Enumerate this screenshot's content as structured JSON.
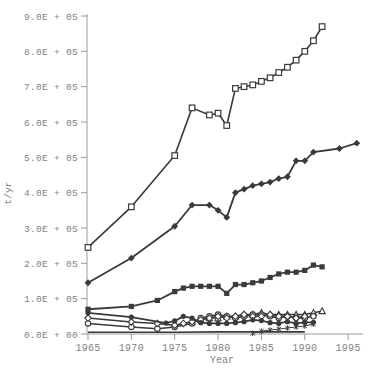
{
  "page": {
    "background": "#ffffff"
  },
  "chart_data": {
    "type": "line",
    "title": "",
    "xlabel": "Year",
    "ylabel": "t/yr",
    "xlim": [
      1965,
      1996.6
    ],
    "ylim": [
      0,
      900000
    ],
    "grid": false,
    "legend": "none",
    "frame": "left-bottom-only",
    "x_ticks": [
      1965,
      1970,
      1975,
      1980,
      1985,
      1990,
      1995
    ],
    "x_tick_labels": [
      "1965",
      "1970",
      "1975",
      "1980",
      "1985",
      "1990",
      "1995"
    ],
    "y_ticks": [
      0,
      100000,
      200000,
      300000,
      400000,
      500000,
      600000,
      700000,
      800000,
      900000
    ],
    "y_tick_labels": [
      "0.0E + 00",
      "1.0E + 05",
      "2.0E + 05",
      "3.0E + 05",
      "4.0E + 05",
      "5.0E + 05",
      "6.0E + 05",
      "7.0E + 05",
      "8.0E + 05",
      "9.0E + 05"
    ],
    "colors": {
      "line": "#3a3a3a",
      "axis": "#9b9b9b",
      "tick_text": "#7f7f7f",
      "open_marker_fill": "#ffffff"
    },
    "series": [
      {
        "name": "series-open-square",
        "marker": "square-open",
        "points": [
          [
            1965,
            245000
          ],
          [
            1970,
            360000
          ],
          [
            1975,
            505000
          ],
          [
            1977,
            640000
          ],
          [
            1979,
            620000
          ],
          [
            1980,
            625000
          ],
          [
            1981,
            590000
          ],
          [
            1982,
            695000
          ],
          [
            1983,
            700000
          ],
          [
            1984,
            705000
          ],
          [
            1985,
            715000
          ],
          [
            1986,
            725000
          ],
          [
            1987,
            740000
          ],
          [
            1988,
            755000
          ],
          [
            1989,
            775000
          ],
          [
            1990,
            800000
          ],
          [
            1991,
            830000
          ],
          [
            1992,
            870000
          ]
        ]
      },
      {
        "name": "series-filled-diamond-large",
        "marker": "diamond-filled",
        "points": [
          [
            1965,
            145000
          ],
          [
            1970,
            215000
          ],
          [
            1975,
            305000
          ],
          [
            1977,
            365000
          ],
          [
            1979,
            365000
          ],
          [
            1980,
            350000
          ],
          [
            1981,
            330000
          ],
          [
            1982,
            400000
          ],
          [
            1983,
            410000
          ],
          [
            1984,
            420000
          ],
          [
            1985,
            425000
          ],
          [
            1986,
            430000
          ],
          [
            1987,
            440000
          ],
          [
            1988,
            445000
          ],
          [
            1989,
            490000
          ],
          [
            1990,
            490000
          ],
          [
            1991,
            515000
          ],
          [
            1994,
            525000
          ],
          [
            1996,
            540000
          ]
        ]
      },
      {
        "name": "series-filled-square",
        "marker": "square-filled",
        "points": [
          [
            1965,
            70000
          ],
          [
            1970,
            78000
          ],
          [
            1973,
            95000
          ],
          [
            1975,
            120000
          ],
          [
            1976,
            130000
          ],
          [
            1977,
            135000
          ],
          [
            1978,
            135000
          ],
          [
            1979,
            135000
          ],
          [
            1980,
            135000
          ],
          [
            1981,
            115000
          ],
          [
            1982,
            140000
          ],
          [
            1983,
            140000
          ],
          [
            1984,
            145000
          ],
          [
            1985,
            150000
          ],
          [
            1986,
            160000
          ],
          [
            1987,
            170000
          ],
          [
            1988,
            175000
          ],
          [
            1989,
            175000
          ],
          [
            1990,
            180000
          ],
          [
            1991,
            195000
          ],
          [
            1992,
            190000
          ]
        ]
      },
      {
        "name": "series-open-triangle",
        "marker": "triangle-open",
        "points": [
          [
            1977,
            35000
          ],
          [
            1978,
            40000
          ],
          [
            1979,
            45000
          ],
          [
            1980,
            45000
          ],
          [
            1981,
            50000
          ],
          [
            1982,
            50000
          ],
          [
            1983,
            55000
          ],
          [
            1984,
            55000
          ],
          [
            1985,
            60000
          ],
          [
            1986,
            55000
          ],
          [
            1987,
            55000
          ],
          [
            1988,
            55000
          ],
          [
            1989,
            55000
          ],
          [
            1990,
            55000
          ],
          [
            1991,
            60000
          ],
          [
            1992,
            65000
          ]
        ]
      },
      {
        "name": "series-open-circle",
        "marker": "circle-open",
        "points": [
          [
            1965,
            30000
          ],
          [
            1970,
            20000
          ],
          [
            1973,
            15000
          ],
          [
            1975,
            20000
          ],
          [
            1977,
            30000
          ],
          [
            1978,
            45000
          ],
          [
            1979,
            50000
          ],
          [
            1980,
            55000
          ],
          [
            1981,
            50000
          ],
          [
            1982,
            45000
          ],
          [
            1983,
            50000
          ],
          [
            1984,
            55000
          ],
          [
            1985,
            55000
          ],
          [
            1986,
            50000
          ],
          [
            1987,
            45000
          ],
          [
            1988,
            50000
          ],
          [
            1989,
            45000
          ],
          [
            1990,
            45000
          ],
          [
            1991,
            50000
          ]
        ]
      },
      {
        "name": "series-open-diamond",
        "marker": "diamond-open",
        "points": [
          [
            1965,
            45000
          ],
          [
            1970,
            34000
          ],
          [
            1973,
            30000
          ],
          [
            1975,
            25000
          ],
          [
            1976,
            30000
          ],
          [
            1977,
            35000
          ],
          [
            1978,
            40000
          ],
          [
            1979,
            45000
          ],
          [
            1980,
            50000
          ],
          [
            1981,
            45000
          ],
          [
            1982,
            50000
          ],
          [
            1983,
            55000
          ],
          [
            1984,
            50000
          ],
          [
            1985,
            50000
          ],
          [
            1986,
            55000
          ],
          [
            1987,
            50000
          ],
          [
            1988,
            50000
          ],
          [
            1989,
            45000
          ],
          [
            1990,
            50000
          ]
        ]
      },
      {
        "name": "series-filled-circle",
        "marker": "circle-filled",
        "points": [
          [
            1965,
            60000
          ],
          [
            1970,
            48000
          ],
          [
            1974,
            31000
          ],
          [
            1975,
            37000
          ],
          [
            1976,
            50000
          ],
          [
            1977,
            45000
          ],
          [
            1978,
            32000
          ],
          [
            1979,
            30000
          ],
          [
            1980,
            30000
          ],
          [
            1981,
            30000
          ],
          [
            1982,
            32000
          ],
          [
            1983,
            35000
          ],
          [
            1984,
            40000
          ],
          [
            1985,
            38000
          ],
          [
            1986,
            32000
          ],
          [
            1987,
            30000
          ],
          [
            1988,
            35000
          ],
          [
            1989,
            30000
          ],
          [
            1990,
            33000
          ],
          [
            1991,
            33000
          ]
        ]
      },
      {
        "name": "series-cross",
        "marker": "cross",
        "points": [
          [
            1984,
            2000
          ],
          [
            1985,
            8000
          ],
          [
            1986,
            11000
          ],
          [
            1987,
            14000
          ],
          [
            1988,
            17000
          ],
          [
            1989,
            20000
          ],
          [
            1990,
            23000
          ],
          [
            1991,
            28000
          ]
        ]
      },
      {
        "name": "series-baseline-line",
        "marker": "none",
        "points": [
          [
            1965,
            5000
          ],
          [
            1970,
            5000
          ],
          [
            1975,
            5000
          ],
          [
            1980,
            6000
          ],
          [
            1985,
            6000
          ],
          [
            1990,
            6000
          ]
        ]
      }
    ]
  }
}
